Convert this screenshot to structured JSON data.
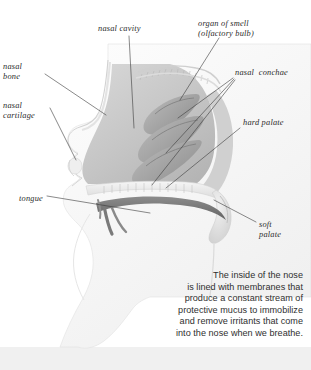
{
  "diagram": {
    "labels": [
      {
        "id": "nasal-cavity",
        "text": "nasal cavity"
      },
      {
        "id": "organ-of-smell",
        "text": "organ of smell\n(olfactory bulb)"
      },
      {
        "id": "nasal-bone",
        "text": "nasal\nbone"
      },
      {
        "id": "nasal-cartilage",
        "text": "nasal\ncartilage"
      },
      {
        "id": "nasal-conchae",
        "text": "nasal  conchae"
      },
      {
        "id": "hard-palate",
        "text": "hard palate"
      },
      {
        "id": "soft-palate",
        "text": "soft\npalate"
      },
      {
        "id": "tongue",
        "text": "tongue"
      }
    ],
    "caption": "The inside of the nose\nis lined with membranes that\nproduce a constant stream of\nprotective mucus to immobilize\nand remove irritants that come\ninto the nose when we breathe.",
    "colors": {
      "background": "#ffffff",
      "band": "#ededed",
      "tissue_light": "#e6e6e6",
      "tissue_mid": "#c9c9c9",
      "tissue_dark": "#9a9a9a",
      "tongue": "#6e6e6e",
      "leader_line": "#3a3a3a",
      "label_text": "#2b2b2b",
      "caption_text": "#2f2f2f"
    }
  }
}
